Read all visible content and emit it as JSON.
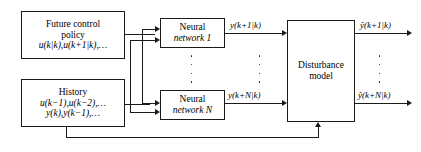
{
  "diagram": {
    "background_color": "#ffffff",
    "line_color": "#1a1a1a",
    "blocks": {
      "future_policy": {
        "line1": "Future control",
        "line2": "policy",
        "line3": "u(k|k),u(k+1|k),…"
      },
      "history": {
        "line1": "History",
        "line2": "u(k−1),u(k−2),…",
        "line3": "y(k),y(k−1),…"
      },
      "neural_network_1": {
        "line1": "Neural",
        "line2": "network 1"
      },
      "neural_network_N": {
        "line1": "Neural",
        "line2": "network N"
      },
      "disturbance_model": {
        "line1": "Disturbance",
        "line2": "model"
      }
    },
    "signals": {
      "nn1_output": "y(k+1|k)",
      "nnN_output": "y(k+N|k)",
      "predicted_output_1": "ŷ(k+1|k)",
      "predicted_output_N": "ŷ(k+N|k)"
    },
    "ellipsis": {
      "between_networks": "⋮",
      "between_signals": "⋮",
      "between_outputs": "⋮"
    }
  }
}
